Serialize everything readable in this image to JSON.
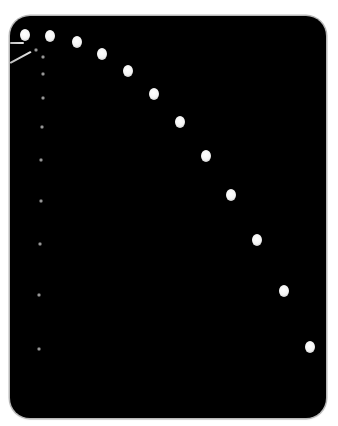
{
  "scene": {
    "background": "#ffffff",
    "panel_color": "#000000",
    "panel_border": "#b8b8b8"
  },
  "bright_dots": [
    {
      "x": 25,
      "y": 35
    },
    {
      "x": 50,
      "y": 36
    },
    {
      "x": 77,
      "y": 42
    },
    {
      "x": 102,
      "y": 54
    },
    {
      "x": 128,
      "y": 71
    },
    {
      "x": 154,
      "y": 94
    },
    {
      "x": 180,
      "y": 122
    },
    {
      "x": 206,
      "y": 156
    },
    {
      "x": 231,
      "y": 195
    },
    {
      "x": 257,
      "y": 240
    },
    {
      "x": 284,
      "y": 291
    },
    {
      "x": 310,
      "y": 347
    }
  ],
  "dim_dots": [
    {
      "x": 36,
      "y": 50
    },
    {
      "x": 43,
      "y": 57
    },
    {
      "x": 43,
      "y": 74
    },
    {
      "x": 43,
      "y": 98
    },
    {
      "x": 42,
      "y": 127
    },
    {
      "x": 41,
      "y": 160
    },
    {
      "x": 41,
      "y": 201
    },
    {
      "x": 40,
      "y": 244
    },
    {
      "x": 39,
      "y": 295
    },
    {
      "x": 39,
      "y": 349
    }
  ],
  "streaks": [
    {
      "x": 10,
      "y": 42,
      "length": 14,
      "angle": 0
    },
    {
      "x": 10,
      "y": 62,
      "length": 24,
      "angle": -28
    }
  ]
}
